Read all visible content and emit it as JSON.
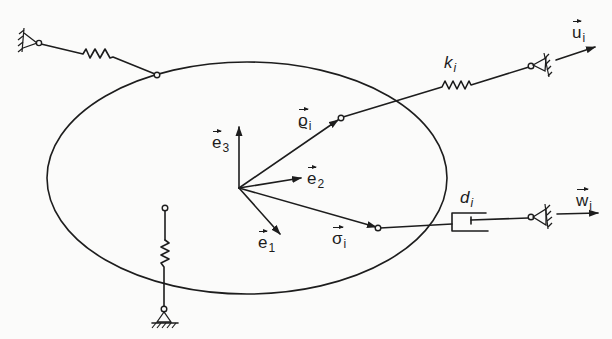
{
  "diagram": {
    "type": "rigid body with springs and damper",
    "body": {
      "shape": "ellipse",
      "center": [
        247,
        178
      ],
      "rx": 200,
      "ry": 116
    },
    "labels": {
      "e1": {
        "base": "e",
        "sub": "1"
      },
      "e2": {
        "base": "e",
        "sub": "2"
      },
      "e3": {
        "base": "e",
        "sub": "3"
      },
      "rho": {
        "base": "ϱ",
        "sub": "i"
      },
      "sigma": {
        "base": "σ",
        "sub": "i"
      },
      "k": {
        "base": "k",
        "sub": "i"
      },
      "d": {
        "base": "d",
        "sub": "i"
      },
      "u": {
        "base": "u",
        "sub": "i"
      },
      "w": {
        "base": "w",
        "sub": "i"
      }
    },
    "elements": [
      {
        "name": "top-left spring",
        "from": "fixed wall",
        "to": "body"
      },
      {
        "name": "spring k_i",
        "from": "body point rho_i",
        "to": "moving support u_i"
      },
      {
        "name": "damper d_i",
        "from": "body point sigma_i",
        "to": "moving support w_i"
      },
      {
        "name": "bottom spring",
        "from": "body",
        "to": "ground"
      }
    ],
    "colors": {
      "ink": "#1d1d1d",
      "paper": "#fbfbfa"
    }
  }
}
